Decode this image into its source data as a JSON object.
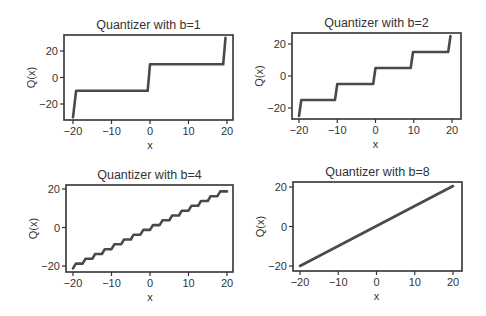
{
  "figure": {
    "width": 486,
    "height": 316,
    "line_color": "#4a4a4a",
    "axis_color": "#333333"
  },
  "chart_data": [
    {
      "type": "line",
      "title": "Quantizer with b=1",
      "xlabel": "x",
      "ylabel": "Q(x)",
      "xlim": [
        -21.5,
        22
      ],
      "ylim": [
        -33,
        33
      ],
      "xticks": [
        -20,
        -10,
        0,
        10,
        20
      ],
      "xtick_labels": [
        "−20",
        "−10",
        "0",
        "10",
        "20"
      ],
      "yticks": [
        -20,
        0,
        20
      ],
      "ytick_labels": [
        "−20",
        "0",
        "20"
      ],
      "grid": false,
      "x": [
        -20,
        -19.2,
        -0.6,
        0,
        19,
        19.6
      ],
      "y": [
        -30,
        -10,
        -10,
        10,
        10,
        30
      ],
      "layout": {
        "left": 64,
        "right": 233,
        "top": 35,
        "bottom": 120,
        "x_at_m20": 73,
        "x_at_p20": 227,
        "y_at_p20": 51,
        "y_at_m20": 104
      }
    },
    {
      "type": "line",
      "title": "Quantizer with b=2",
      "xlabel": "x",
      "ylabel": "Q(x)",
      "xlim": [
        -21.5,
        22
      ],
      "ylim": [
        -28,
        28
      ],
      "xticks": [
        -20,
        -10,
        0,
        10,
        20
      ],
      "xtick_labels": [
        "−20",
        "−10",
        "0",
        "10",
        "20"
      ],
      "yticks": [
        -20,
        0,
        20
      ],
      "ytick_labels": [
        "−20",
        "0",
        "20"
      ],
      "grid": false,
      "x": [
        -20,
        -19.4,
        -10.6,
        -10,
        -0.6,
        0,
        9.2,
        9.8,
        19,
        19.6
      ],
      "y": [
        -25,
        -15,
        -15,
        -5,
        -5,
        5,
        5,
        15,
        15,
        25
      ],
      "layout": {
        "left": 292,
        "right": 461,
        "top": 33,
        "bottom": 119,
        "x_at_m20": 299,
        "x_at_p20": 452,
        "y_at_p20": 44,
        "y_at_m20": 108
      }
    },
    {
      "type": "line",
      "title": "Quantizer with b=4",
      "xlabel": "x",
      "ylabel": "Q(x)",
      "xlim": [
        -21.5,
        22
      ],
      "ylim": [
        -23,
        23
      ],
      "xticks": [
        -20,
        -10,
        0,
        10,
        20
      ],
      "xtick_labels": [
        "−20",
        "−10",
        "0",
        "10",
        "20"
      ],
      "yticks": [
        -20,
        0,
        20
      ],
      "ytick_labels": [
        "−20",
        "0",
        "20"
      ],
      "grid": false,
      "step": {
        "start": -20,
        "end": 20,
        "width": 2.5,
        "first_level": -21.25,
        "rise_fraction": 0.3
      },
      "x": [
        -20,
        20
      ],
      "y": [
        -21.25,
        21.25
      ],
      "layout": {
        "left": 66,
        "right": 233,
        "top": 185,
        "bottom": 272,
        "x_at_m20": 73,
        "x_at_p20": 227,
        "y_at_p20": 189,
        "y_at_m20": 266
      }
    },
    {
      "type": "line",
      "title": "Quantizer with b=8",
      "xlabel": "x",
      "ylabel": "Q(x)",
      "xlim": [
        -21.5,
        22
      ],
      "ylim": [
        -21.5,
        22.5
      ],
      "xticks": [
        -20,
        -10,
        0,
        10,
        20
      ],
      "xtick_labels": [
        "−20",
        "−10",
        "0",
        "10",
        "20"
      ],
      "yticks": [
        -20,
        0,
        20
      ],
      "ytick_labels": [
        "−20",
        "0",
        "20"
      ],
      "grid": false,
      "x": [
        -20,
        20
      ],
      "y": [
        -20,
        20.5
      ],
      "layout": {
        "left": 293,
        "right": 462,
        "top": 182,
        "bottom": 271,
        "x_at_m20": 300,
        "x_at_p20": 453,
        "y_at_p20": 187,
        "y_at_m20": 266
      }
    }
  ]
}
